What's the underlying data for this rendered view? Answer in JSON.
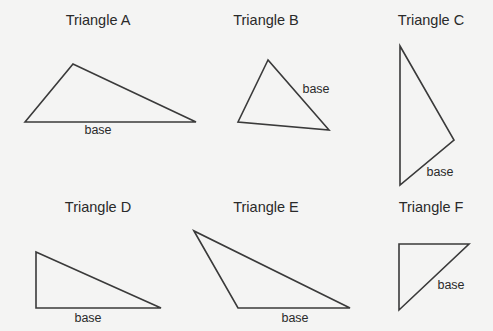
{
  "diagram": {
    "stroke_color": "#3a3a3a",
    "background": "#f4f4f3",
    "triangles": [
      {
        "title": "Triangle A",
        "base_label": "base",
        "title_pos": [
          98,
          21
        ],
        "label_pos": [
          98,
          130
        ],
        "points": [
          [
            25,
            122
          ],
          [
            73,
            64
          ],
          [
            196,
            122
          ]
        ]
      },
      {
        "title": "Triangle B",
        "base_label": "base",
        "title_pos": [
          266,
          21
        ],
        "label_pos": [
          316,
          89
        ],
        "points": [
          [
            268,
            60
          ],
          [
            238,
            122
          ],
          [
            329,
            130
          ]
        ]
      },
      {
        "title": "Triangle C",
        "base_label": "base",
        "title_pos": [
          431,
          21
        ],
        "label_pos": [
          440,
          172
        ],
        "points": [
          [
            400,
            46
          ],
          [
            454,
            140
          ],
          [
            400,
            185
          ]
        ]
      },
      {
        "title": "Triangle D",
        "base_label": "base",
        "title_pos": [
          98,
          208
        ],
        "label_pos": [
          88,
          318
        ],
        "points": [
          [
            36,
            252
          ],
          [
            36,
            308
          ],
          [
            161,
            308
          ]
        ]
      },
      {
        "title": "Triangle E",
        "base_label": "base",
        "title_pos": [
          266,
          208
        ],
        "label_pos": [
          295,
          318
        ],
        "points": [
          [
            194,
            231
          ],
          [
            238,
            308
          ],
          [
            350,
            308
          ]
        ]
      },
      {
        "title": "Triangle F",
        "base_label": "base",
        "title_pos": [
          431,
          208
        ],
        "label_pos": [
          451,
          285
        ],
        "points": [
          [
            399,
            244
          ],
          [
            469,
            244
          ],
          [
            399,
            310
          ]
        ]
      }
    ]
  }
}
